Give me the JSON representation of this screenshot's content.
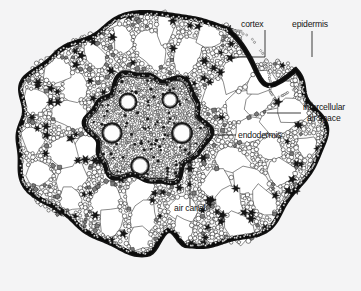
{
  "figure": {
    "kind": "botanical-cross-section-micrograph",
    "background_color": "#f4f4f5",
    "ink_color": "#141414",
    "paper_tone": "#fbfbfb"
  },
  "labels": [
    {
      "id": "cortex",
      "text": "cortex",
      "text_x": 241,
      "text_y": 27,
      "anchor": "start",
      "leader": "M265,30 L265,57 L232,57"
    },
    {
      "id": "epidermis",
      "text": "epidermis",
      "text_x": 292,
      "text_y": 27,
      "anchor": "start",
      "leader": "M312,31 L312,57"
    },
    {
      "id": "intercellular-air-space",
      "text": "intercellular",
      "text_x": 303,
      "text_y": 110,
      "anchor": "start",
      "leader": "M301,113 L267,113"
    },
    {
      "id": "intercellular-air-space-2",
      "text": "air space",
      "text_x": 307,
      "text_y": 121,
      "anchor": "start",
      "leader": ""
    },
    {
      "id": "endodermis",
      "text": "endodermis",
      "text_x": 238,
      "text_y": 138,
      "anchor": "start",
      "leader": "M236,135 L205,135"
    },
    {
      "id": "air-canal",
      "text": "air canal",
      "text_x": 174,
      "text_y": 211,
      "anchor": "start",
      "leader": "M190,206 L190,129"
    }
  ],
  "structures": {
    "epidermis_label": "epidermis",
    "cortex_label": "cortex",
    "endodermis_label": "endodermis",
    "air_canal_label": "air canal",
    "intercellular_air_space_label": "intercellular air space"
  },
  "chart_data": {
    "type": "diagram",
    "title": "",
    "annotations": [
      "cortex",
      "epidermis",
      "intercellular air space",
      "endodermis",
      "air canal"
    ]
  }
}
